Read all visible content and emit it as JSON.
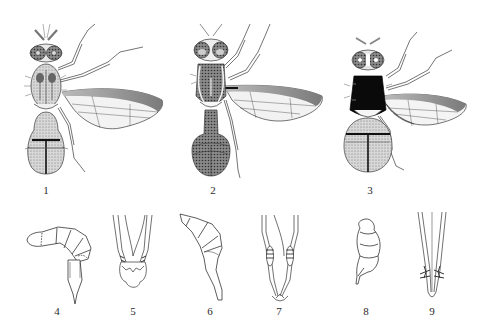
{
  "plate": {
    "background": "#ffffff",
    "ink_color": "#2a2a2a",
    "figures": [
      {
        "id": 1,
        "label": "1",
        "subject": "fly dorsal view, spotted thorax, abdomen with dark cross band and median stripe",
        "label_x": 46,
        "label_y": 185
      },
      {
        "id": 2,
        "label": "2",
        "subject": "fly dorsal view, elongate petiolate abdomen, dark thorax with pale stripes",
        "label_x": 213,
        "label_y": 185
      },
      {
        "id": 3,
        "label": "3",
        "subject": "fly dorsal view, black thorax, abdomen with dark T-shaped mark",
        "label_x": 370,
        "label_y": 185
      },
      {
        "id": 4,
        "label": "4",
        "subject": "abdomen / ovipositor lateral view, curved segmented",
        "label_x": 57,
        "label_y": 306
      },
      {
        "id": 5,
        "label": "5",
        "subject": "aculeus tip with serrated margins",
        "label_x": 133,
        "label_y": 306
      },
      {
        "id": 6,
        "label": "6",
        "subject": "abdomen / ovipositor lateral view, elongate tapering",
        "label_x": 210,
        "label_y": 306
      },
      {
        "id": 7,
        "label": "7",
        "subject": "aculeus tip with lateral teeth",
        "label_x": 279,
        "label_y": 306
      },
      {
        "id": 8,
        "label": "8",
        "subject": "abdomen lateral view, compact segmented",
        "label_x": 366,
        "label_y": 306
      },
      {
        "id": 9,
        "label": "9",
        "subject": "aculeus tip with lateral spines",
        "label_x": 432,
        "label_y": 306
      }
    ]
  }
}
